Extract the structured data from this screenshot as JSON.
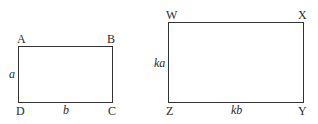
{
  "diagram": {
    "type": "similar-rectangles",
    "rect1": {
      "vertices": {
        "top_left": "A",
        "top_right": "B",
        "bottom_right": "C",
        "bottom_left": "D"
      },
      "side_left": "a",
      "side_bottom": "b"
    },
    "rect2": {
      "vertices": {
        "top_left": "W",
        "top_right": "X",
        "bottom_right": "Y",
        "bottom_left": "Z"
      },
      "side_left": "ka",
      "side_bottom": "kb"
    },
    "stroke_color": "#333333"
  }
}
